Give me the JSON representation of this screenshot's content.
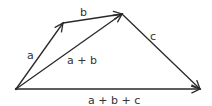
{
  "diagram": {
    "stroke_color": "#2a2a2a",
    "label_color": "#333333",
    "points": {
      "origin": [
        16,
        89
      ],
      "a_tip": [
        63,
        23
      ],
      "b_tip": [
        122,
        14
      ],
      "c_tip": [
        200,
        89
      ]
    },
    "vectors": [
      {
        "id": "a",
        "label": "a",
        "from": "origin",
        "to": "a_tip",
        "label_pos": [
          27,
          59
        ]
      },
      {
        "id": "b",
        "label": "b",
        "from": "a_tip",
        "to": "b_tip",
        "label_pos": [
          80,
          16
        ]
      },
      {
        "id": "c",
        "label": "c",
        "from": "b_tip",
        "to": "c_tip",
        "label_pos": [
          150,
          40
        ]
      },
      {
        "id": "a_plus_b",
        "label": "a + b",
        "from": "origin",
        "to": "b_tip",
        "label_pos": [
          67,
          64
        ]
      },
      {
        "id": "a_plus_b_plus_c",
        "label": "a + b + c",
        "from": "origin",
        "to": "c_tip",
        "label_pos": [
          88,
          104
        ]
      }
    ]
  }
}
